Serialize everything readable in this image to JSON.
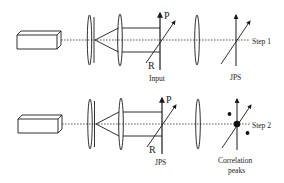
{
  "figure": {
    "type": "optical-setup-diagram",
    "stroke_color": "#1a1a1a",
    "background": "#ffffff"
  },
  "rows": [
    {
      "id": "step-1",
      "step_label": "Step 1",
      "plane_1": {
        "label": "Input",
        "axis_labels": {
          "p": "P",
          "r": "R"
        }
      },
      "plane_2": {
        "label": "JPS"
      },
      "correlation_peaks": false
    },
    {
      "id": "step-2",
      "step_label": "Step 2",
      "plane_1": {
        "label": "JPS",
        "axis_labels": {
          "p": "P",
          "r": "R"
        }
      },
      "plane_2": {
        "label_line1": "Correlation",
        "label_line2": "peaks"
      },
      "correlation_peaks": true
    }
  ],
  "components": [
    "laser-source",
    "spatial-filter-lens",
    "pinhole",
    "collimating-lens",
    "input-plane",
    "fourier-lens",
    "output-plane"
  ]
}
